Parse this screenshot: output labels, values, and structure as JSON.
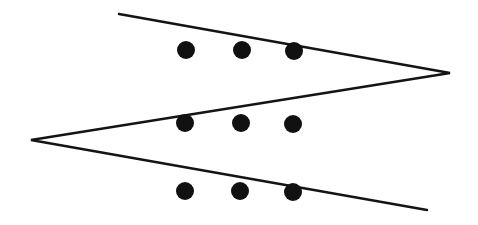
{
  "diagram": {
    "background": "#ffffff",
    "stroke_color": "#141414",
    "fill_color": "#111111",
    "stroke_width": 2.5,
    "zigzag_line": {
      "points": [
        [
          119,
          14
        ],
        [
          450,
          73
        ],
        [
          31,
          140
        ],
        [
          427,
          210
        ]
      ]
    },
    "dot_radius": 9,
    "dots": [
      {
        "row": 1,
        "col": 1,
        "x": 186,
        "y": 50
      },
      {
        "row": 1,
        "col": 2,
        "x": 242,
        "y": 50
      },
      {
        "row": 1,
        "col": 3,
        "x": 294,
        "y": 51
      },
      {
        "row": 2,
        "col": 1,
        "x": 185,
        "y": 123
      },
      {
        "row": 2,
        "col": 2,
        "x": 241,
        "y": 123
      },
      {
        "row": 2,
        "col": 3,
        "x": 293,
        "y": 124
      },
      {
        "row": 3,
        "col": 1,
        "x": 185,
        "y": 191
      },
      {
        "row": 3,
        "col": 2,
        "x": 240,
        "y": 191
      },
      {
        "row": 3,
        "col": 3,
        "x": 293,
        "y": 192
      }
    ]
  }
}
